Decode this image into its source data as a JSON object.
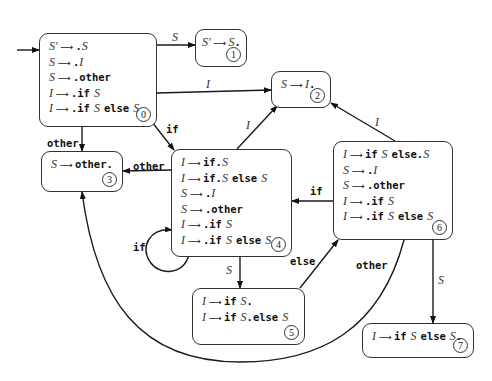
{
  "diagram": {
    "type": "LR(0) automaton for if-else grammar",
    "states": [
      {
        "id": "0",
        "items": [
          {
            "lhs": "S'",
            "rhs": [
              {
                "t": "dot"
              },
              {
                "nt": "S"
              }
            ]
          },
          {
            "lhs": "S",
            "rhs": [
              {
                "t": "dot"
              },
              {
                "nt": "I"
              }
            ]
          },
          {
            "lhs": "S",
            "rhs": [
              {
                "t": "dot"
              },
              {
                "tok": "other"
              }
            ]
          },
          {
            "lhs": "I",
            "rhs": [
              {
                "t": "dot"
              },
              {
                "tok": "if"
              },
              {
                "nt": "S"
              }
            ]
          },
          {
            "lhs": "I",
            "rhs": [
              {
                "t": "dot"
              },
              {
                "tok": "if"
              },
              {
                "nt": "S"
              },
              {
                "tok": "else"
              },
              {
                "nt": "S"
              }
            ]
          }
        ]
      },
      {
        "id": "1",
        "items": [
          {
            "lhs": "S'",
            "rhs": [
              {
                "nt": "S"
              },
              {
                "t": "dot"
              }
            ]
          }
        ]
      },
      {
        "id": "2",
        "items": [
          {
            "lhs": "S",
            "rhs": [
              {
                "nt": "I"
              },
              {
                "t": "dot"
              }
            ]
          }
        ]
      },
      {
        "id": "3",
        "items": [
          {
            "lhs": "S",
            "rhs": [
              {
                "tok": "other"
              },
              {
                "t": "dot"
              }
            ]
          }
        ]
      },
      {
        "id": "4",
        "items": [
          {
            "lhs": "I",
            "rhs": [
              {
                "tok": "if"
              },
              {
                "t": "dot"
              },
              {
                "nt": "S"
              }
            ]
          },
          {
            "lhs": "I",
            "rhs": [
              {
                "tok": "if"
              },
              {
                "t": "dot"
              },
              {
                "nt": "S"
              },
              {
                "tok": "else"
              },
              {
                "nt": "S"
              }
            ]
          },
          {
            "lhs": "S",
            "rhs": [
              {
                "t": "dot"
              },
              {
                "nt": "I"
              }
            ]
          },
          {
            "lhs": "S",
            "rhs": [
              {
                "t": "dot"
              },
              {
                "tok": "other"
              }
            ]
          },
          {
            "lhs": "I",
            "rhs": [
              {
                "t": "dot"
              },
              {
                "tok": "if"
              },
              {
                "nt": "S"
              }
            ]
          },
          {
            "lhs": "I",
            "rhs": [
              {
                "t": "dot"
              },
              {
                "tok": "if"
              },
              {
                "nt": "S"
              },
              {
                "tok": "else"
              },
              {
                "nt": "S"
              }
            ]
          }
        ]
      },
      {
        "id": "5",
        "items": [
          {
            "lhs": "I",
            "rhs": [
              {
                "tok": "if"
              },
              {
                "nt": "S"
              },
              {
                "t": "dot"
              }
            ]
          },
          {
            "lhs": "I",
            "rhs": [
              {
                "tok": "if"
              },
              {
                "nt": "S"
              },
              {
                "t": "dot"
              },
              {
                "tok": "else"
              },
              {
                "nt": "S"
              }
            ]
          }
        ]
      },
      {
        "id": "6",
        "items": [
          {
            "lhs": "I",
            "rhs": [
              {
                "tok": "if"
              },
              {
                "nt": "S"
              },
              {
                "tok": "else"
              },
              {
                "t": "dot"
              },
              {
                "nt": "S"
              }
            ]
          },
          {
            "lhs": "S",
            "rhs": [
              {
                "t": "dot"
              },
              {
                "nt": "I"
              }
            ]
          },
          {
            "lhs": "S",
            "rhs": [
              {
                "t": "dot"
              },
              {
                "tok": "other"
              }
            ]
          },
          {
            "lhs": "I",
            "rhs": [
              {
                "t": "dot"
              },
              {
                "tok": "if"
              },
              {
                "nt": "S"
              }
            ]
          },
          {
            "lhs": "I",
            "rhs": [
              {
                "t": "dot"
              },
              {
                "tok": "if"
              },
              {
                "nt": "S"
              },
              {
                "tok": "else"
              },
              {
                "nt": "S"
              }
            ]
          }
        ]
      },
      {
        "id": "7",
        "items": [
          {
            "lhs": "I",
            "rhs": [
              {
                "tok": "if"
              },
              {
                "nt": "S"
              },
              {
                "tok": "else"
              },
              {
                "nt": "S"
              },
              {
                "t": "dot"
              }
            ]
          }
        ]
      }
    ],
    "edges": [
      {
        "from": "start",
        "to": "0",
        "label": ""
      },
      {
        "from": "0",
        "to": "1",
        "label": "S"
      },
      {
        "from": "0",
        "to": "2",
        "label": "I"
      },
      {
        "from": "0",
        "to": "3",
        "label": "other"
      },
      {
        "from": "0",
        "to": "4",
        "label": "if"
      },
      {
        "from": "4",
        "to": "2",
        "label": "I"
      },
      {
        "from": "4",
        "to": "3",
        "label": "other"
      },
      {
        "from": "4",
        "to": "4",
        "label": "if"
      },
      {
        "from": "4",
        "to": "5",
        "label": "S"
      },
      {
        "from": "5",
        "to": "6",
        "label": "else"
      },
      {
        "from": "6",
        "to": "2",
        "label": "I"
      },
      {
        "from": "6",
        "to": "4",
        "label": "if"
      },
      {
        "from": "6",
        "to": "3",
        "label": "other"
      },
      {
        "from": "6",
        "to": "7",
        "label": "S"
      }
    ],
    "labels": {
      "e01": "S",
      "e02": "I",
      "e03": "other",
      "e04": "if",
      "e42": "I",
      "e43": "other",
      "e44": "if",
      "e45": "S",
      "e56": "else",
      "e62": "I",
      "e64": "if",
      "e63": "other",
      "e67": "S"
    },
    "arrow_glyph": "⟶",
    "dot_glyph": "."
  }
}
